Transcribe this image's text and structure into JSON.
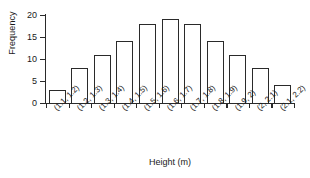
{
  "chart_data": {
    "type": "bar",
    "title": "",
    "xlabel": "Height (m)",
    "ylabel": "Frequency",
    "categories": [
      "(1.1, 1.2)",
      "(1.2, 1.3)",
      "(1.3, 1.4)",
      "(1.4, 1.5)",
      "(1.5, 1.6)",
      "(1.6, 1.7)",
      "(1.7, 1.8)",
      "(1.8, 1.9)",
      "(1.9, 2)",
      "(2, 2.1)",
      "(2.1, 2.2)"
    ],
    "values": [
      3,
      8,
      11,
      14,
      18,
      19,
      18,
      14,
      11,
      8,
      4
    ],
    "ylim": [
      0,
      20
    ],
    "yticks": [
      0,
      5,
      10,
      15,
      20
    ],
    "ytick_labels": [
      "0",
      "5",
      "10",
      "15",
      "20"
    ],
    "grid": false,
    "legend": false,
    "bar_fill_color": "#ffffff",
    "bar_edge_color": "#2a2a2a",
    "axis_color": "#2a2a2a"
  }
}
